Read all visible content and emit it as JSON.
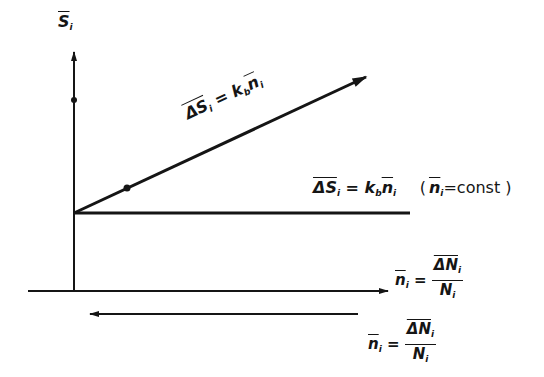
{
  "axes": {
    "y_label": {
      "symbol": "S",
      "subscript": "i",
      "overbar": true
    },
    "x_label": {
      "lhs": "n",
      "lhs_sub": "i",
      "num": "ΔN",
      "num_sub": "i",
      "den": "N",
      "den_sub": "i"
    }
  },
  "lines": {
    "diagonal": {
      "label_prefix": "ΔS",
      "label_sub": "i",
      "eq": "= k",
      "k_sub": "b",
      "n": "n",
      "n_sub": "i"
    },
    "horizontal": {
      "label_prefix": "ΔS",
      "label_sub": "i",
      "eq": "= k",
      "k_sub": "b",
      "n": "n",
      "n_sub": "i",
      "condition_open": "(",
      "condition_n": "n",
      "condition_sub": "i",
      "condition_text": "=const )"
    }
  },
  "lower_arrow": {
    "lhs": "n",
    "lhs_sub": "i",
    "num": "ΔN",
    "num_sub": "i",
    "den": "N",
    "den_sub": "i"
  },
  "colors": {
    "ink": "#151515",
    "background": "#ffffff"
  }
}
